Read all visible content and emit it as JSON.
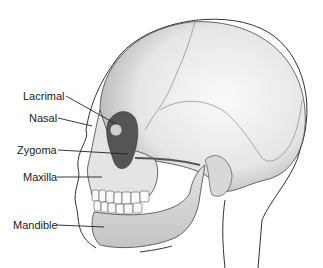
{
  "diagram": {
    "labels": [
      {
        "id": "lacrimal",
        "text": "Lacrimal",
        "x": 23,
        "y": 90,
        "line": [
          66,
          96,
          116,
          124
        ]
      },
      {
        "id": "nasal",
        "text": "Nasal",
        "x": 29,
        "y": 112,
        "line": [
          58,
          118,
          92,
          126
        ]
      },
      {
        "id": "zygoma",
        "text": "Zygoma",
        "x": 17,
        "y": 144,
        "line": [
          58,
          150,
          128,
          154
        ]
      },
      {
        "id": "maxilla",
        "text": "Maxilla",
        "x": 23,
        "y": 172,
        "line": [
          57,
          177,
          102,
          177
        ]
      },
      {
        "id": "mandible",
        "text": "Mandible",
        "x": 13,
        "y": 220,
        "line": [
          57,
          225,
          104,
          227
        ]
      }
    ],
    "colors": {
      "bone": "#ececec",
      "bone_shadow": "#c8c8c8",
      "orbit_dark": "#555555",
      "outline": "#333333",
      "leader": "#222222"
    }
  }
}
